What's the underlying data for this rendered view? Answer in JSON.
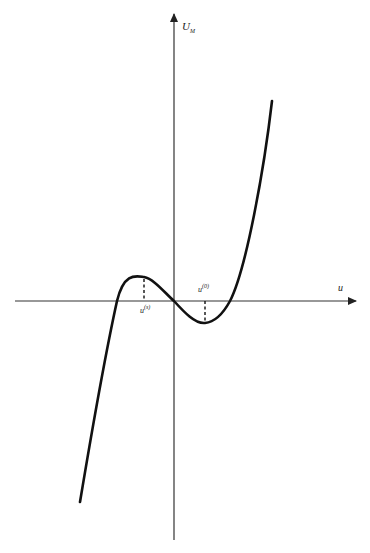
{
  "diagram": {
    "type": "cubic-function-plot",
    "axes": {
      "y_label": "U",
      "y_label_subscript": "M",
      "x_label": "u"
    },
    "markers": [
      {
        "label": "u",
        "superscript": "(s)",
        "position": "local-maximum"
      },
      {
        "label": "u",
        "superscript": "(0)",
        "position": "local-minimum"
      }
    ],
    "colors": {
      "curve": "#111111",
      "axes": "#333333",
      "background": "#ffffff"
    }
  }
}
